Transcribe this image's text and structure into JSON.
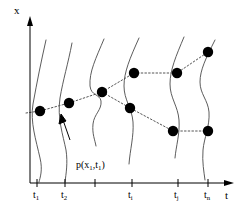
{
  "figure": {
    "title": "",
    "axes": {
      "x_axis": {
        "label": "x",
        "orientation": "vertical",
        "origin_px": [
          30,
          183
        ],
        "top_px": [
          30,
          18
        ]
      },
      "t_axis": {
        "label": "t",
        "orientation": "horizontal",
        "origin_px": [
          30,
          183
        ],
        "right_px": [
          232,
          183
        ]
      }
    },
    "ticks": [
      {
        "id": "t1",
        "label_text": "t",
        "sub": "1",
        "x_px": 37,
        "show_label": true
      },
      {
        "id": "t2",
        "label_text": "t",
        "sub": "2",
        "x_px": 65,
        "show_label": true
      },
      {
        "id": "t3",
        "label_text": "",
        "sub": "",
        "x_px": 95,
        "show_label": false
      },
      {
        "id": "ti",
        "label_text": "t",
        "sub": "i",
        "x_px": 132,
        "show_label": true
      },
      {
        "id": "tj",
        "label_text": "t",
        "sub": "j",
        "x_px": 178,
        "show_label": true
      },
      {
        "id": "tn",
        "label_text": "t",
        "sub": "n",
        "x_px": 208,
        "show_label": true
      }
    ],
    "density_label": {
      "text": "p(x",
      "sub1": "1",
      "mid": ",t",
      "sub2": "1",
      "close": ")"
    },
    "annotation_arrow": {
      "from_px": [
        72,
        135
      ],
      "to_px": [
        62,
        118
      ],
      "points_to": "first-density-curve"
    },
    "colors": {
      "ink": "#000000",
      "curve": "#4a4a4a",
      "dot": "#000000",
      "dotted_path": "#555555",
      "background": "#ffffff"
    },
    "dots": [
      {
        "id": "d1",
        "t": "t1",
        "x_px": 40,
        "y_px": 111
      },
      {
        "id": "d2",
        "t": "t2",
        "x_px": 69,
        "y_px": 103
      },
      {
        "id": "d3",
        "t": "t3",
        "x_px": 102,
        "y_px": 92
      },
      {
        "id": "d4",
        "t": "ti",
        "x_px": 134,
        "y_px": 73
      },
      {
        "id": "d5",
        "t": "ti",
        "x_px": 130,
        "y_px": 108
      },
      {
        "id": "d6",
        "t": "tj",
        "x_px": 177,
        "y_px": 73
      },
      {
        "id": "d7",
        "t": "tj",
        "x_px": 173,
        "y_px": 131
      },
      {
        "id": "d8",
        "t": "tn",
        "x_px": 208,
        "y_px": 52
      },
      {
        "id": "d9",
        "t": "tn",
        "x_px": 208,
        "y_px": 131
      }
    ],
    "paths": [
      {
        "id": "trunk",
        "points": [
          [
            26,
            113
          ],
          [
            40,
            111
          ],
          [
            69,
            103
          ],
          [
            102,
            92
          ]
        ]
      },
      {
        "id": "branch-upper",
        "points": [
          [
            102,
            92
          ],
          [
            134,
            73
          ],
          [
            177,
            73
          ],
          [
            208,
            52
          ]
        ]
      },
      {
        "id": "branch-lower",
        "points": [
          [
            102,
            92
          ],
          [
            130,
            108
          ],
          [
            173,
            131
          ],
          [
            208,
            131
          ]
        ]
      }
    ],
    "curves": [
      {
        "id": "curve-t1",
        "x_px": 37,
        "d": "M 46,40 C 41,62 37,82 33,104 C 30,122 36,140 40,158 C 43,170 40,178 39,182"
      },
      {
        "id": "curve-t2",
        "x_px": 65,
        "d": "M 72,43 C 68,64 63,80 60,98 C 57,118 63,135 66,150 C 68,163 66,174 65,182"
      },
      {
        "id": "curve-t3",
        "x_px": 95,
        "d": "M 104,39 C 96,58 89,72 90,86 C 91,96 100,94 101,101 C 102,110 94,114 93,124 C 92,134 95,140 96,146"
      },
      {
        "id": "curve-ti",
        "x_px": 132,
        "d": "M 139,38 C 130,58 124,72 124,86 C 124,100 132,108 133,122 C 134,136 130,150 129,164"
      },
      {
        "id": "curve-tj",
        "x_px": 178,
        "d": "M 184,37 C 176,56 170,70 170,84 C 170,98 178,106 179,120 C 180,134 176,146 175,158"
      },
      {
        "id": "curve-tn",
        "x_px": 208,
        "d": "M 215,40 C 206,58 200,70 200,82 C 200,94 208,100 209,112 C 210,126 204,138 203,150 C 202,162 204,172 205,180"
      }
    ]
  }
}
